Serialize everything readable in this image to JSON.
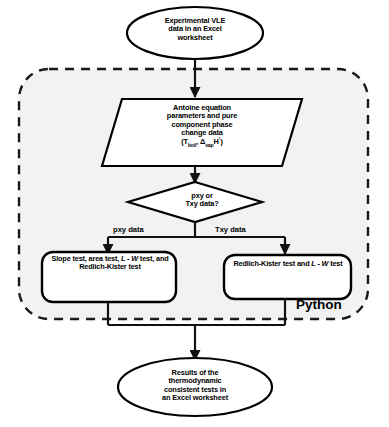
{
  "diagram": {
    "background_color": "#ffffff",
    "container": {
      "label": "Python",
      "border_style": "dashed",
      "border_color": "#1a1a1a",
      "fill_color": "#f2f2f2"
    },
    "nodes": [
      {
        "id": "start",
        "shape": "ellipse",
        "name": "start-terminator",
        "lines": [
          "Experimental VLE",
          "data in an Excel",
          "worksheet"
        ],
        "text": "Experimental VLE data in an Excel worksheet"
      },
      {
        "id": "antoine",
        "shape": "parallelogram",
        "name": "input-data-node",
        "lines": [
          "Antoine equation",
          "parameters and pure",
          "component phase",
          "change data"
        ],
        "formula": {
          "open": "(T",
          "sub1": "boil",
          "mid": ", Δ",
          "sub2": "vap",
          "var": "H",
          "sup": "°",
          "close": ")"
        },
        "text": "Antoine equation parameters and pure component phase change data (Tboil, ΔvapH°)"
      },
      {
        "id": "decision",
        "shape": "diamond",
        "name": "decision-node",
        "lines": [
          "pxy or",
          "Txy data?"
        ],
        "text": "pxy or Txy data?"
      },
      {
        "id": "process_left",
        "shape": "rounded-rectangle",
        "name": "process-node-pxy",
        "segments": [
          {
            "text": "Slope test, area test, ",
            "italic": false
          },
          {
            "text": "L - W",
            "italic": true
          },
          {
            "text": " test, and Redlich-Kister test",
            "italic": false
          }
        ],
        "text": "Slope test, area test, L-W test, and Redlich-Kister test"
      },
      {
        "id": "process_right",
        "shape": "rounded-rectangle",
        "name": "process-node-txy",
        "segments": [
          {
            "text": "Redlich-Kister test and ",
            "italic": false
          },
          {
            "text": "L - W",
            "italic": true
          },
          {
            "text": " test",
            "italic": false
          }
        ],
        "text": "Redlich-Kister test and L-W test"
      },
      {
        "id": "end",
        "shape": "ellipse",
        "name": "end-terminator",
        "lines": [
          "Results of the",
          "thermodynamic",
          "consistent tests in",
          "an Excel worksheet"
        ],
        "text": "Results of the thermodynamic consistent tests in an Excel worksheet"
      }
    ],
    "edge_labels": [
      {
        "id": "pxy",
        "name": "branch-label-pxy",
        "text": "pxy data"
      },
      {
        "id": "txy",
        "name": "branch-label-txy",
        "text": "Txy data"
      }
    ]
  }
}
